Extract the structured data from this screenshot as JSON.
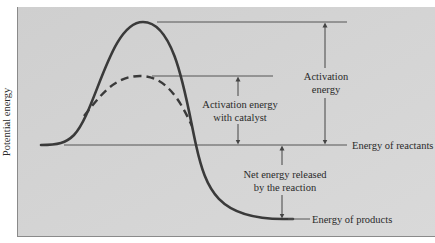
{
  "y_axis_label": "Potential energy",
  "labels": {
    "activation_energy": [
      "Activation",
      "energy"
    ],
    "activation_energy_catalyst": [
      "Activation energy",
      "with catalyst"
    ],
    "energy_of_reactants": "Energy of reactants",
    "net_energy": [
      "Net energy released",
      "by the reaction"
    ],
    "energy_of_products": "Energy of products"
  },
  "curves": {
    "uncatalyzed": {
      "style": "solid",
      "description": "Reaction pathway without catalyst"
    },
    "catalyzed": {
      "style": "dashed",
      "description": "Reaction pathway with catalyst"
    }
  },
  "energy_levels": {
    "reactants": 0,
    "uncatalyzed_peak": 1.0,
    "catalyzed_peak": 0.56,
    "products": -0.6
  },
  "colors": {
    "panel_fill": "#d3d3d3",
    "curve": "#3a3a3a",
    "guide_line": "#555555",
    "text": "#2a2a2a"
  }
}
